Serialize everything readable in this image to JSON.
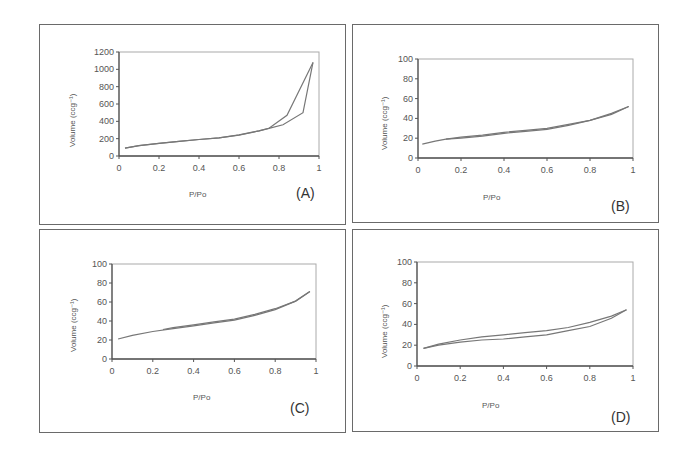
{
  "chart_data": [
    {
      "id": "A",
      "type": "line",
      "panel_label": "(A)",
      "xlabel": "P/Po",
      "ylabel": "Volume (ccg⁻¹)",
      "xlim": [
        0,
        1
      ],
      "ylim": [
        0,
        1200
      ],
      "xticks": [
        "0",
        "0.2",
        "0.4",
        "0.6",
        "0.8",
        "1"
      ],
      "yticks": [
        "0",
        "200",
        "400",
        "600",
        "800",
        "1000",
        "1200"
      ],
      "grid": false,
      "series": [
        {
          "name": "adsorption",
          "x": [
            0.03,
            0.1,
            0.2,
            0.3,
            0.4,
            0.5,
            0.6,
            0.7,
            0.75,
            0.82,
            0.92,
            0.97
          ],
          "y": [
            90,
            120,
            145,
            170,
            190,
            210,
            240,
            290,
            320,
            360,
            500,
            1080
          ]
        },
        {
          "name": "desorption",
          "x": [
            0.97,
            0.84,
            0.75,
            0.7,
            0.6,
            0.5,
            0.4,
            0.3,
            0.2,
            0.1,
            0.03
          ],
          "y": [
            1080,
            470,
            320,
            290,
            245,
            210,
            190,
            170,
            145,
            120,
            90
          ]
        }
      ]
    },
    {
      "id": "B",
      "type": "line",
      "panel_label": "(B)",
      "xlabel": "P/Po",
      "ylabel": "Volume (ccg⁻¹)",
      "xlim": [
        0,
        1
      ],
      "ylim": [
        0,
        100
      ],
      "xticks": [
        "0",
        "0.2",
        "0.4",
        "0.6",
        "0.8",
        "1"
      ],
      "yticks": [
        "0",
        "20",
        "40",
        "60",
        "80",
        "100"
      ],
      "grid": false,
      "series": [
        {
          "name": "adsorption",
          "x": [
            0.02,
            0.08,
            0.13,
            0.2,
            0.3,
            0.4,
            0.5,
            0.6,
            0.7,
            0.8,
            0.9,
            0.98
          ],
          "y": [
            14,
            17,
            19,
            20,
            22,
            25,
            27,
            29,
            33,
            38,
            44,
            52
          ]
        },
        {
          "name": "desorption",
          "x": [
            0.98,
            0.9,
            0.8,
            0.7,
            0.6,
            0.5,
            0.4,
            0.3,
            0.2,
            0.13
          ],
          "y": [
            52,
            45,
            38,
            34,
            30,
            28,
            26,
            23,
            21,
            19
          ]
        }
      ]
    },
    {
      "id": "C",
      "type": "line",
      "panel_label": "(C)",
      "xlabel": "P/Po",
      "ylabel": "Volume (ccg⁻¹)",
      "xlim": [
        0,
        1
      ],
      "ylim": [
        0,
        100
      ],
      "xticks": [
        "0",
        "0.2",
        "0.4",
        "0.6",
        "0.8",
        "1"
      ],
      "yticks": [
        "0",
        "20",
        "40",
        "60",
        "80",
        "100"
      ],
      "grid": false,
      "series": [
        {
          "name": "adsorption",
          "x": [
            0.03,
            0.1,
            0.2,
            0.3,
            0.4,
            0.5,
            0.6,
            0.7,
            0.8,
            0.9,
            0.97
          ],
          "y": [
            21,
            25,
            29,
            32,
            35,
            38,
            41,
            46,
            52,
            61,
            71
          ]
        },
        {
          "name": "desorption",
          "x": [
            0.97,
            0.9,
            0.8,
            0.7,
            0.6,
            0.5,
            0.4,
            0.3,
            0.25
          ],
          "y": [
            71,
            61,
            53,
            47,
            42,
            39,
            36,
            33,
            31
          ]
        }
      ]
    },
    {
      "id": "D",
      "type": "line",
      "panel_label": "(D)",
      "xlabel": "P/Po",
      "ylabel": "Volume (ccg⁻¹)",
      "xlim": [
        0,
        1
      ],
      "ylim": [
        0,
        100
      ],
      "xticks": [
        "0",
        "0.2",
        "0.4",
        "0.6",
        "0.8",
        "1"
      ],
      "yticks": [
        "0",
        "20",
        "40",
        "60",
        "80",
        "100"
      ],
      "grid": false,
      "series": [
        {
          "name": "adsorption",
          "x": [
            0.03,
            0.1,
            0.2,
            0.3,
            0.4,
            0.5,
            0.6,
            0.7,
            0.8,
            0.9,
            0.97
          ],
          "y": [
            17,
            20,
            23,
            25,
            26,
            28,
            30,
            34,
            38,
            46,
            54
          ]
        },
        {
          "name": "desorption",
          "x": [
            0.97,
            0.9,
            0.8,
            0.7,
            0.6,
            0.5,
            0.4,
            0.3,
            0.2,
            0.1,
            0.03
          ],
          "y": [
            54,
            48,
            42,
            37,
            34,
            32,
            30,
            28,
            25,
            21,
            17
          ]
        }
      ]
    }
  ],
  "layout_colors": {
    "line": "#777777",
    "axis": "#555555",
    "frame": "#aaaaaa"
  }
}
